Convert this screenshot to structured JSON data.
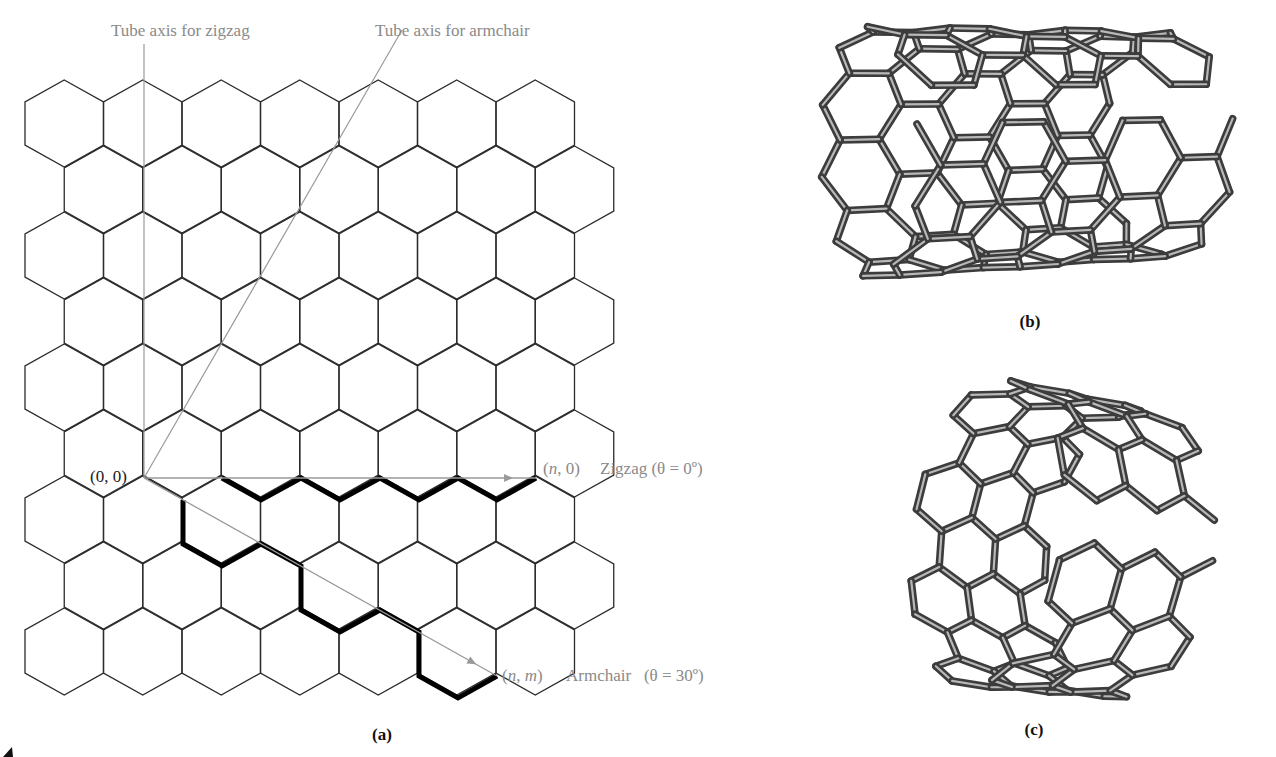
{
  "figure": {
    "panel_a": {
      "caption": "(a)",
      "labels": {
        "zigzag_axis": "Tube axis for zigzag",
        "armchair_axis": "Tube axis for armchair",
        "origin": "(0, 0)",
        "zigzag_vector_coord_n": "n",
        "zigzag_vector_coord_rest": ", 0)",
        "zigzag_vector_open": "(",
        "zigzag_name": "Zigzag (θ = 0º)",
        "armchair_vector_open": "(",
        "armchair_vector_n": "n",
        "armchair_vector_sep": ", ",
        "armchair_vector_m": "m",
        "armchair_vector_close": ")",
        "armchair_name": "Armchair   (θ = 30º)"
      },
      "lattice": {
        "rows": 9,
        "cols": 7,
        "x0": 25,
        "y0": 80,
        "hex_width": 78.5,
        "hex_height": 87,
        "row_pitch": 66,
        "odd_row_offset": 39.25,
        "stroke": "#2b2b2b"
      },
      "origin_point": [
        144,
        478
      ],
      "zigzag_endpoint": [
        536,
        478
      ],
      "armchair_endpoint": [
        497,
        676
      ],
      "zigzag_axis_line": [
        [
          144,
          478
        ],
        [
          144,
          44
        ]
      ],
      "armchair_axis_line": [
        [
          144,
          478
        ],
        [
          402,
          30
        ]
      ],
      "zigzag_path": [
        [
          222,
          478
        ],
        [
          261,
          500
        ],
        [
          301,
          478
        ],
        [
          340,
          500
        ],
        [
          380,
          478
        ],
        [
          419,
          500
        ],
        [
          458,
          478
        ],
        [
          497,
          500
        ],
        [
          536,
          478
        ]
      ],
      "armchair_path": [
        [
          183,
          500
        ],
        [
          183,
          544
        ],
        [
          222,
          566
        ],
        [
          261,
          544
        ],
        [
          301,
          566
        ],
        [
          301,
          610
        ],
        [
          340,
          632
        ],
        [
          380,
          610
        ],
        [
          419,
          632
        ],
        [
          419,
          676
        ],
        [
          458,
          698
        ],
        [
          497,
          676
        ]
      ],
      "axis_color": "#9a9a9a",
      "path_color": "#000000"
    },
    "panel_b": {
      "caption": "(b)",
      "tube_type": "zigzag",
      "render": {
        "cx": 1030,
        "cy": 148,
        "radius": 118,
        "length": 330,
        "yaw": -62,
        "pitch": 14,
        "roll": -8,
        "bond": 10,
        "circ_cells": 10,
        "axial_cells": 5
      }
    },
    "panel_c": {
      "caption": "(c)",
      "tube_type": "armchair",
      "render": {
        "cx": 1034,
        "cy": 540,
        "radius": 150,
        "length": 150,
        "yaw": -58,
        "pitch": 6,
        "roll": 4,
        "bond": 10,
        "circ_cells": 8,
        "axial_cells": 3
      }
    },
    "bond_colors": {
      "outer": "#3c3c3c",
      "inner": "#b8b8b8"
    }
  }
}
